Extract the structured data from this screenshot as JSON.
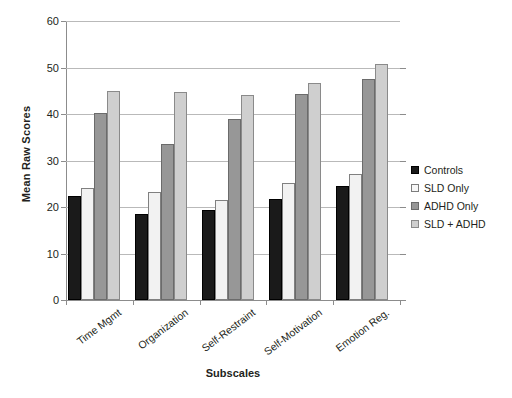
{
  "chart_data": {
    "type": "bar",
    "title": "",
    "xlabel": "Subscales",
    "ylabel": "Mean Raw Scores",
    "ylim": [
      0,
      60
    ],
    "ytick_labels": [
      "0",
      "10",
      "20",
      "30",
      "40",
      "50",
      "60"
    ],
    "yticks": [
      0,
      10,
      20,
      30,
      40,
      50,
      60
    ],
    "grid": true,
    "legend_position": "right",
    "categories": [
      "Time Mgmt",
      "Organization",
      "Self-Restraint",
      "Self-Motivation",
      "Emotion Reg."
    ],
    "series": [
      {
        "name": "Controls",
        "color": "#1a1a1a",
        "values": [
          22.3,
          18.4,
          19.3,
          21.8,
          24.5
        ]
      },
      {
        "name": "SLD Only",
        "color": "#f2f2f2",
        "values": [
          24.0,
          23.2,
          21.5,
          25.2,
          27.0
        ]
      },
      {
        "name": "ADHD Only",
        "color": "#979797",
        "values": [
          40.2,
          33.5,
          39.0,
          44.2,
          47.5
        ]
      },
      {
        "name": "SLD + ADHD",
        "color": "#cfcfcf",
        "values": [
          44.9,
          44.8,
          44.0,
          46.6,
          50.7
        ]
      }
    ]
  }
}
